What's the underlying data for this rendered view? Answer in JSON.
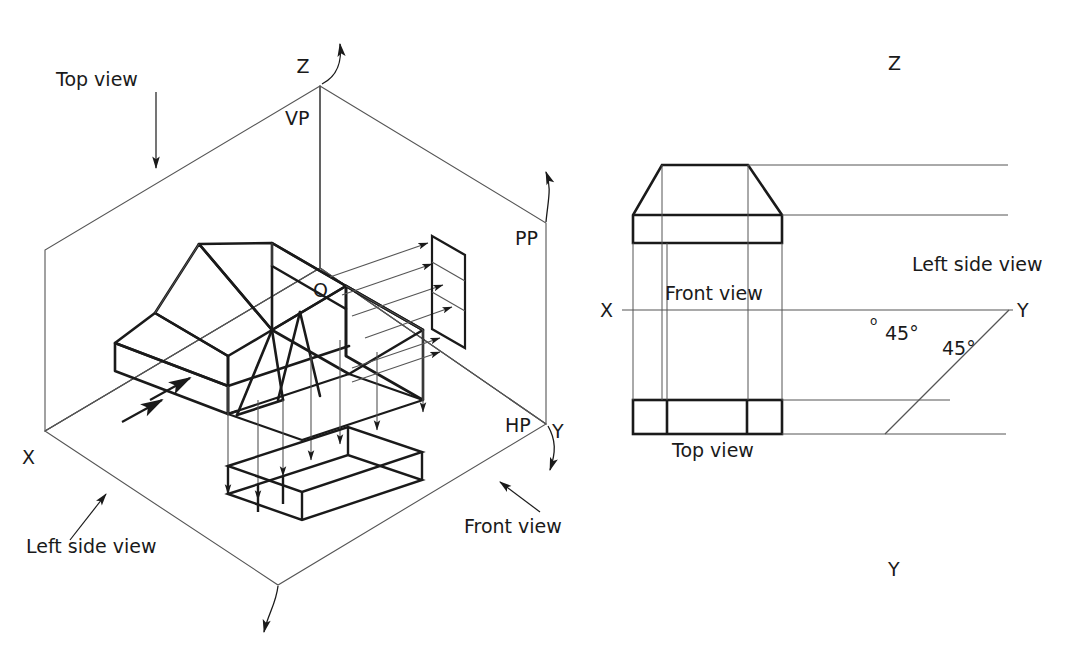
{
  "figure": {
    "kind": "orthographic-projection-diagram",
    "background_color": "#ffffff",
    "ink_color": "#1a1a1a",
    "thin_color": "#555555"
  },
  "isometric": {
    "labels": {
      "axis_z": "Z",
      "axis_x": "X",
      "axis_y": "Y",
      "plane_vp": "VP",
      "plane_hp": "HP",
      "plane_pp": "PP",
      "origin": "O",
      "top_view": "Top view",
      "front_view": "Front view",
      "left_side_view": "Left side view"
    }
  },
  "orthographic": {
    "labels": {
      "axis_z_top": "Z",
      "axis_y_bottom": "Y",
      "axis_x_left": "X",
      "axis_y_right": "Y",
      "origin": "o",
      "front_view": "Front view",
      "top_view": "Top view",
      "left_side_view": "Left side view",
      "angle_upper": "45°",
      "angle_lower": "45°"
    }
  }
}
